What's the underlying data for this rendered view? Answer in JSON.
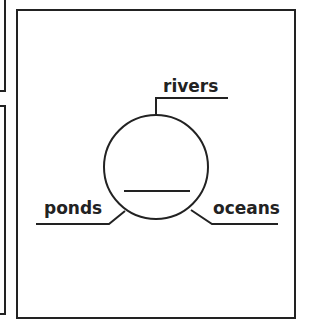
{
  "diagram": {
    "center_node": {
      "label": "",
      "shape": "circle",
      "blank_line": true
    },
    "branches": [
      {
        "label": "rivers",
        "position": "top"
      },
      {
        "label": "ponds",
        "position": "bottom-left"
      },
      {
        "label": "oceans",
        "position": "bottom-right"
      }
    ]
  },
  "colors": {
    "stroke": "#222222",
    "background": "#ffffff"
  }
}
